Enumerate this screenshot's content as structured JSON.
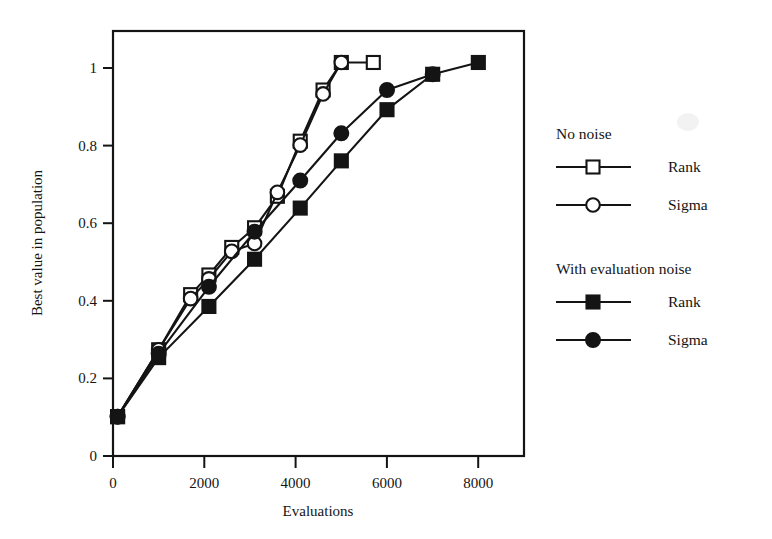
{
  "chart_data": {
    "type": "line",
    "title": "",
    "xlabel": "Evaluations",
    "ylabel": "Best value in population",
    "xlim": [
      0,
      9000
    ],
    "ylim": [
      0,
      1.08
    ],
    "xticks": [
      0,
      2000,
      4000,
      6000,
      8000
    ],
    "xtick_labels": [
      "0",
      "2000",
      "4000",
      "6000",
      "8000"
    ],
    "yticks": [
      0,
      0.2,
      0.4,
      0.6,
      0.8,
      1
    ],
    "ytick_labels": [
      "0",
      "0.2",
      "0.4",
      "0.6",
      "0.8",
      "1"
    ],
    "grid": false,
    "legend_position": "right",
    "series": [
      {
        "name": "No noise - Rank",
        "group": "No noise",
        "label": "Rank",
        "marker": "open-square",
        "color": "#141414",
        "x": [
          100,
          1000,
          1700,
          2100,
          2600,
          3100,
          3600,
          4100,
          4600,
          5000,
          5700
        ],
        "y": [
          0.1,
          0.27,
          0.41,
          0.46,
          0.53,
          0.58,
          0.66,
          0.8,
          0.93,
          1.0,
          1.0
        ]
      },
      {
        "name": "No noise - Sigma",
        "group": "No noise",
        "label": "Sigma",
        "marker": "open-circle",
        "color": "#141414",
        "x": [
          100,
          1000,
          1700,
          2100,
          2600,
          3100,
          3600,
          4100,
          4600,
          5000
        ],
        "y": [
          0.1,
          0.27,
          0.4,
          0.45,
          0.52,
          0.54,
          0.67,
          0.79,
          0.92,
          1.0
        ]
      },
      {
        "name": "With evaluation noise - Rank",
        "group": "With evaluation noise",
        "label": "Rank",
        "marker": "filled-square",
        "color": "#141414",
        "x": [
          100,
          1000,
          2100,
          3100,
          4100,
          5000,
          6000,
          7000,
          8000
        ],
        "y": [
          0.1,
          0.25,
          0.38,
          0.5,
          0.63,
          0.75,
          0.88,
          0.97,
          1.0
        ]
      },
      {
        "name": "With evaluation noise - Sigma",
        "group": "With evaluation noise",
        "label": "Sigma",
        "marker": "filled-circle",
        "color": "#141414",
        "x": [
          100,
          1000,
          2100,
          3100,
          4100,
          5000,
          6000,
          7000
        ],
        "y": [
          0.1,
          0.26,
          0.43,
          0.57,
          0.7,
          0.82,
          0.93,
          0.97
        ]
      }
    ]
  },
  "legend": {
    "groups": [
      {
        "heading": "No noise",
        "entries": [
          {
            "label": "Rank",
            "marker": "open-square"
          },
          {
            "label": "Sigma",
            "marker": "open-circle"
          }
        ]
      },
      {
        "heading": "With evaluation noise",
        "entries": [
          {
            "label": "Rank",
            "marker": "filled-square"
          },
          {
            "label": "Sigma",
            "marker": "filled-circle"
          }
        ]
      }
    ]
  },
  "axes": {
    "x_title": "Evaluations",
    "y_title": "Best value in population",
    "xtick_labels": [
      "0",
      "2000",
      "4000",
      "6000",
      "8000"
    ],
    "ytick_labels": [
      "0",
      "0.2",
      "0.4",
      "0.6",
      "0.8",
      "1"
    ]
  },
  "colors": {
    "ink": "#141414",
    "background": "#ffffff"
  }
}
